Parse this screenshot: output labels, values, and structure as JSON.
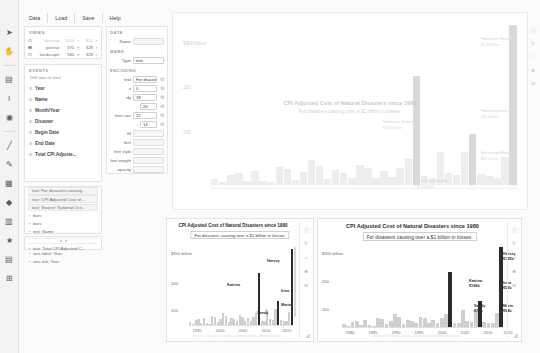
{
  "app": {
    "menu": [
      "Data",
      "Load",
      "Save",
      "Help"
    ]
  },
  "left_rail": {
    "icons": [
      "cursor-icon",
      "hand-icon",
      "minus-icon",
      "rect-mark-icon",
      "text-mark-icon",
      "symbol-mark-icon",
      "divider-icon",
      "line-mark-icon",
      "pen-icon",
      "image-mark-icon",
      "icon-mark-icon",
      "data-axis-icon",
      "star-icon",
      "legend-icon",
      "guide-icon"
    ]
  },
  "views_panel": {
    "title": "VIEWS",
    "rows": [
      {
        "selected": false,
        "name": "desktop",
        "w": "1024",
        "x": "×",
        "h": "810",
        "check": "✓",
        "muted": true
      },
      {
        "selected": true,
        "name": "portrait",
        "w": "375",
        "x": "×",
        "h": "328",
        "check": "✓",
        "muted": false
      },
      {
        "selected": false,
        "name": "landscape",
        "w": "580",
        "x": "×",
        "h": "328",
        "check": "✓",
        "muted": false
      }
    ]
  },
  "events_panel": {
    "title": "EVENTS",
    "count": "208 rows in total",
    "fields": [
      "Year",
      "Name",
      "Month/Year",
      "Disaster",
      "Begin Date",
      "End Date",
      "Total CPI Adjuste..."
    ]
  },
  "layers_panel": {
    "items": [
      {
        "label": "text: For disasters causing...",
        "chip": true
      },
      {
        "label": "text: CPI Adjusted Cost of...",
        "chip": true
      },
      {
        "label": "text: Source: National Oce...",
        "chip": true
      },
      {
        "label": "bars",
        "chip": false
      },
      {
        "label": "bars",
        "chip": false
      },
      {
        "label": "text: Name",
        "chip": false
      },
      {
        "label": "axis label: Total CPI Adjust...",
        "chip": false
      },
      {
        "label": "axis grid: Total CPI Adjuste...",
        "chip": false
      },
      {
        "label": "axis label: Year",
        "chip": false
      },
      {
        "label": "axis tick: Year",
        "chip": false
      }
    ],
    "footer_item": "text: Total CPI Adjusted C..."
  },
  "attributes_panel": {
    "sections": [
      {
        "title": "DATA",
        "rows": [
          {
            "label": "Name",
            "value": "",
            "placeholder": "",
            "gear": false,
            "prefix": ""
          }
        ]
      },
      {
        "title": "MARK",
        "rows": [
          {
            "label": "Type",
            "value": "text",
            "gear": false,
            "prefix": ""
          }
        ]
      },
      {
        "title": "ENCODING",
        "rows": [
          {
            "label": "text",
            "value": "For disasters c...",
            "gear": true,
            "prefix": ""
          },
          {
            "label": "x",
            "value": "0",
            "gear": true,
            "prefix": ""
          },
          {
            "label": "dy",
            "value": "18",
            "gear": true,
            "prefix": ""
          },
          {
            "label": "",
            "value": "20",
            "gear": true,
            "prefix": "↕"
          },
          {
            "label": "font size",
            "value": "12",
            "gear": true,
            "prefix": ""
          },
          {
            "label": "",
            "value": "14",
            "gear": true,
            "prefix": "↕"
          },
          {
            "label": "fill",
            "value": "",
            "gear": false,
            "prefix": ""
          },
          {
            "label": "font",
            "value": "",
            "gear": false,
            "prefix": ""
          },
          {
            "label": "font style",
            "value": "",
            "gear": false,
            "prefix": ""
          },
          {
            "label": "font weight",
            "value": "",
            "gear": false,
            "prefix": ""
          },
          {
            "label": "opacity",
            "value": "",
            "gear": false,
            "prefix": ""
          }
        ]
      }
    ]
  },
  "canvas": {
    "title": "CPI Adjusted Cost of Natural Disasters since 1980",
    "subtitle": "For disasters causing over a $1 billion in losses.",
    "y_labels": [
      "$300 billion",
      "200",
      "100"
    ],
    "annotations": [
      {
        "name": "Hurricane Katrina",
        "value": "$168 billion"
      },
      {
        "name": "Hurricane Sandy",
        "value": "$73 billion"
      },
      {
        "name": "Hurricane Harvey",
        "value": "$128 billion"
      },
      {
        "name": "Hurricane Irma",
        "value": "$52 billion"
      },
      {
        "name": "Hurricane Maria",
        "value": "$94 billion"
      }
    ]
  },
  "right_rail": {
    "icons": [
      "info-icon",
      "pin-icon",
      "zoom-fit-icon",
      "zoom-in-icon",
      "zoom-out-icon"
    ]
  },
  "card_left": {
    "title": "CPI Adjusted Cost of Natural Disasters since 1980",
    "subtitle": "For disasters causing over a $1 billion in losses.",
    "y_labels": [
      "$300 billion",
      "200",
      "100"
    ],
    "x_ticks": [
      "1995",
      "2000",
      "2005",
      "2010",
      "2015"
    ],
    "labels": [
      {
        "name": "Harvey",
        "value": ""
      },
      {
        "name": "Katrina",
        "value": ""
      },
      {
        "name": "Irma",
        "value": ""
      },
      {
        "name": "Maria",
        "value": ""
      },
      {
        "name": "Sandy",
        "value": ""
      }
    ],
    "source": "Source: National Oceanic and Atmospheric Administration",
    "rail_icons": [
      "info-icon",
      "pin-icon",
      "zoom-fit-icon",
      "zoom-in-icon",
      "zoom-out-icon"
    ]
  },
  "card_right": {
    "title": "CPI Adjusted Cost of Natural Disasters since 1980",
    "subtitle": "For disasters causing over a $1 billion in losses.",
    "y_labels": [
      "$300 billion",
      "200",
      "100"
    ],
    "x_ticks": [
      "1980",
      "1985",
      "1990",
      "1995",
      "2000",
      "2005",
      "2010",
      "2015"
    ],
    "labels": [
      {
        "name": "Katrina",
        "value": "$168b"
      },
      {
        "name": "Harvey",
        "value": "$128b"
      },
      {
        "name": "Irma",
        "value": "$52b"
      },
      {
        "name": "Maria",
        "value": "$94b"
      },
      {
        "name": "Sandy",
        "value": "$73b"
      }
    ],
    "source": "Source: National Oceanic and Atmospheric Administration",
    "rail_icons": [
      "info-icon",
      "pin-icon",
      "zoom-fit-icon",
      "zoom-in-icon",
      "zoom-out-icon"
    ]
  },
  "chart_data": {
    "type": "bar",
    "title": "CPI Adjusted Cost of Natural Disasters since 1980",
    "subtitle": "For disasters causing over a $1 billion in losses.",
    "xlabel": "Year",
    "ylabel": "Total CPI Adjusted Cost",
    "ylim": [
      0,
      300
    ],
    "yticks": [
      100,
      200,
      300
    ],
    "ytick_labels": [
      "100",
      "200",
      "$300 billion"
    ],
    "grid": false,
    "legend": "none",
    "categories": [
      1980,
      1981,
      1982,
      1983,
      1984,
      1985,
      1986,
      1987,
      1988,
      1989,
      1990,
      1991,
      1992,
      1993,
      1994,
      1995,
      1996,
      1997,
      1998,
      1999,
      2000,
      2001,
      2002,
      2003,
      2004,
      2005,
      2006,
      2007,
      2008,
      2009,
      2010,
      2011,
      2012,
      2013,
      2014,
      2015,
      2016,
      2017
    ],
    "values": [
      12,
      5,
      18,
      22,
      8,
      26,
      7,
      5,
      34,
      30,
      10,
      24,
      47,
      36,
      12,
      28,
      23,
      14,
      38,
      32,
      14,
      26,
      15,
      32,
      48,
      205,
      16,
      14,
      62,
      22,
      18,
      62,
      96,
      20,
      16,
      14,
      52,
      312
    ],
    "highlighted": [
      {
        "year": 2005,
        "name": "Katrina",
        "value": 168
      },
      {
        "year": 2012,
        "name": "Sandy",
        "value": 73
      },
      {
        "year": 2017,
        "name": "Harvey",
        "value": 128
      },
      {
        "year": 2017,
        "name": "Irma",
        "value": 52
      },
      {
        "year": 2017,
        "name": "Maria",
        "value": 94
      }
    ],
    "source": "Source: National Oceanic and Atmospheric Administration"
  }
}
